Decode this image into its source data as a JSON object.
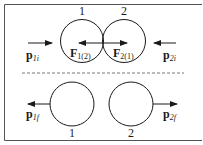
{
  "diagram": {
    "colors": {
      "stroke": "#1a1a1a",
      "frame": "#555555",
      "background": "#ffffff"
    },
    "before": {
      "ball1_label": "1",
      "ball2_label": "2",
      "p1i": {
        "base": "p",
        "sub": "1i"
      },
      "p2i": {
        "base": "p",
        "sub": "2i"
      },
      "F12": {
        "base": "F",
        "sub": "1(2)"
      },
      "F21": {
        "base": "F",
        "sub": "2(1)"
      }
    },
    "after": {
      "ball1_label": "1",
      "ball2_label": "2",
      "p1f": {
        "base": "p",
        "sub": "1f"
      },
      "p2f": {
        "base": "p",
        "sub": "2f"
      }
    }
  }
}
